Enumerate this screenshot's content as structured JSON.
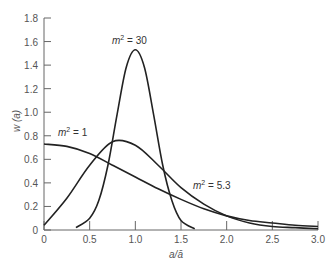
{
  "chart_data": {
    "type": "line",
    "title": "",
    "xlabel": "a/ā",
    "ylabel": "w (a)",
    "xlim": [
      0,
      3.0
    ],
    "ylim": [
      0,
      1.8
    ],
    "grid": false,
    "legend": "none (inline annotations)",
    "x_ticks": [
      "0",
      "0.5",
      "1.0",
      "1.5",
      "2.0",
      "2.5",
      "3.0"
    ],
    "y_ticks": [
      "0",
      "0.2",
      "0.4",
      "0.6",
      "0.8",
      "1.0",
      "1.2",
      "1.4",
      "1.6",
      "1.8"
    ],
    "series": [
      {
        "name": "m² = 1",
        "x": [
          0,
          0.25,
          0.5,
          0.75,
          1.0,
          1.25,
          1.5,
          1.75,
          2.0,
          2.25,
          2.5,
          2.75,
          3.0
        ],
        "values": [
          0.73,
          0.71,
          0.65,
          0.55,
          0.45,
          0.35,
          0.26,
          0.18,
          0.12,
          0.08,
          0.06,
          0.04,
          0.03
        ]
      },
      {
        "name": "m² = 5.3",
        "x": [
          0,
          0.25,
          0.5,
          0.75,
          1.0,
          1.25,
          1.5,
          1.75,
          2.0,
          2.25,
          2.5,
          2.75,
          3.0
        ],
        "values": [
          0.04,
          0.27,
          0.55,
          0.75,
          0.72,
          0.55,
          0.36,
          0.22,
          0.12,
          0.06,
          0.03,
          0.02,
          0.01
        ]
      },
      {
        "name": "m² = 30",
        "x": [
          0.35,
          0.5,
          0.6,
          0.7,
          0.8,
          0.9,
          1.0,
          1.1,
          1.2,
          1.3,
          1.4,
          1.5,
          1.65
        ],
        "values": [
          0.02,
          0.1,
          0.25,
          0.55,
          0.98,
          1.38,
          1.53,
          1.38,
          0.98,
          0.55,
          0.25,
          0.08,
          0.01
        ]
      }
    ],
    "annotations": [
      {
        "text": "m² = 1",
        "x": 0.35,
        "y": 0.8
      },
      {
        "text": "m² = 30",
        "x": 1.0,
        "y": 1.6
      },
      {
        "text": "m² = 5.3",
        "x": 1.85,
        "y": 0.42
      }
    ]
  },
  "labels": {
    "xlabel": "a/ā",
    "ylabel": "w (a)",
    "ann1_m": "m",
    "ann1_rest": " = 1",
    "ann2_m": "m",
    "ann2_rest": " = 30",
    "ann3_m": "m",
    "ann3_rest": " = 5.3",
    "sup": "2"
  }
}
